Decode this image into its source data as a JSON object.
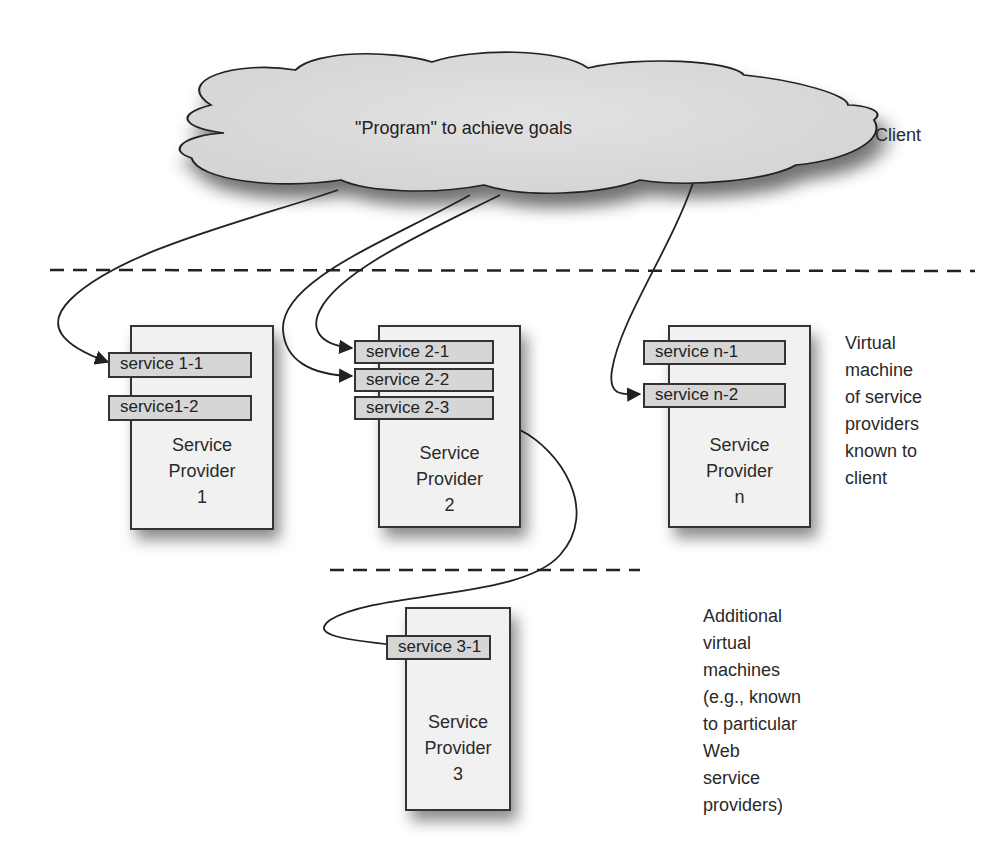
{
  "client": {
    "cloud_text": "\"Program\" to achieve goals",
    "label": "Client"
  },
  "providers": [
    {
      "title_line1": "Service",
      "title_line2": "Provider",
      "id": "1",
      "services": [
        "service 1-1",
        "service1-2"
      ]
    },
    {
      "title_line1": "Service",
      "title_line2": "Provider",
      "id": "2",
      "services": [
        "service 2-1",
        "service 2-2",
        "service 2-3"
      ]
    },
    {
      "title_line1": "Service",
      "title_line2": "Provider",
      "id": "n",
      "services": [
        "service n-1",
        "service n-2"
      ]
    },
    {
      "title_line1": "Service",
      "title_line2": "Provider",
      "id": "3",
      "services": [
        "service 3-1"
      ]
    }
  ],
  "side_labels": {
    "virtual_machine": [
      "Virtual",
      "machine",
      "of service",
      "providers",
      "known to",
      "client"
    ],
    "additional": [
      "Additional",
      "virtual",
      "machines",
      "(e.g., known",
      "to particular",
      "Web",
      "service",
      "providers)"
    ]
  }
}
